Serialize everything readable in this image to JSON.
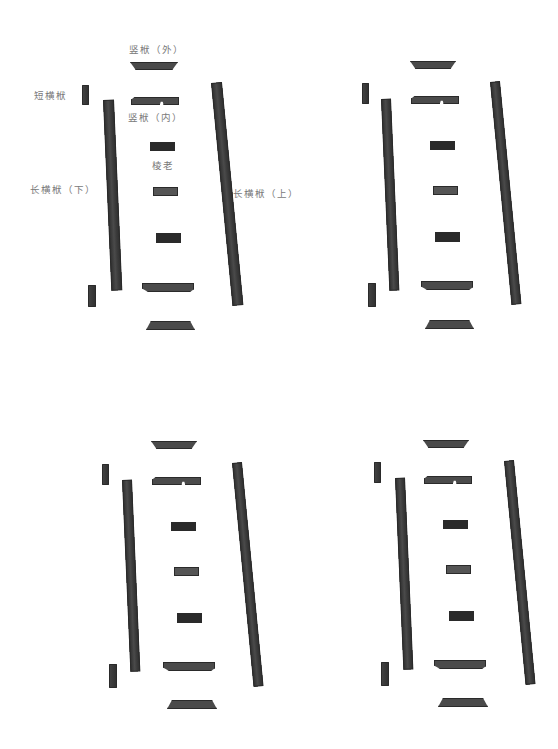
{
  "figure": {
    "labels": {
      "vertical_outer": "竖栿（外）",
      "short_horizontal": "短横栿",
      "vertical_inner": "竖栿（内）",
      "middle_piece": "棱老",
      "long_horizontal_lower": "长横栿（下）",
      "long_horizontal_upper": "长横栿（上）"
    },
    "panels": [
      {
        "name": "view-top-left",
        "x": 0,
        "y": 0
      },
      {
        "name": "view-top-right",
        "x": 280,
        "y": 0
      },
      {
        "name": "view-bottom-left",
        "x": 20,
        "y": 380
      },
      {
        "name": "view-bottom-right",
        "x": 293,
        "y": 380
      }
    ],
    "colors": {
      "wood": "#3f3f3f",
      "wood_dark": "#2a2a2a",
      "label_text": "#7a7a7a",
      "background": "#ffffff"
    }
  }
}
